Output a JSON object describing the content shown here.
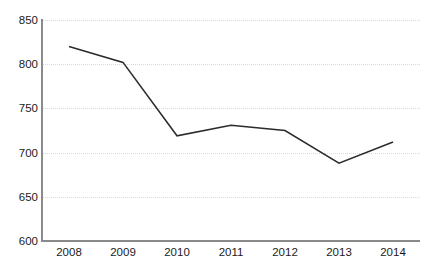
{
  "chart_data": {
    "type": "line",
    "title": "",
    "subtitle": "",
    "xlabel": "",
    "ylabel": "",
    "categories": [
      "2008",
      "2009",
      "2010",
      "2011",
      "2012",
      "2013",
      "2014"
    ],
    "x": [
      2008,
      2009,
      2010,
      2011,
      2012,
      2013,
      2014
    ],
    "values": [
      820,
      802,
      719,
      731,
      725,
      688,
      712
    ],
    "series": [
      {
        "name": "",
        "values": [
          820,
          802,
          719,
          731,
          725,
          688,
          712
        ]
      }
    ],
    "ylim": [
      600,
      850
    ],
    "yticks": [
      600,
      650,
      700,
      750,
      800,
      850
    ],
    "ytick_labels": [
      "600",
      "650",
      "700",
      "750",
      "800",
      "850"
    ],
    "xtick_labels": [
      "2008",
      "2009",
      "2010",
      "2011",
      "2012",
      "2013",
      "2014"
    ],
    "grid": "horizontal-dotted",
    "legend": "none",
    "annotations": [],
    "colors": {
      "line": "#2b2b2b",
      "gridline": "#d8d8e4",
      "axis": "#8a8a8a",
      "text": "#1b1b1b",
      "background": "#ffffff"
    }
  }
}
